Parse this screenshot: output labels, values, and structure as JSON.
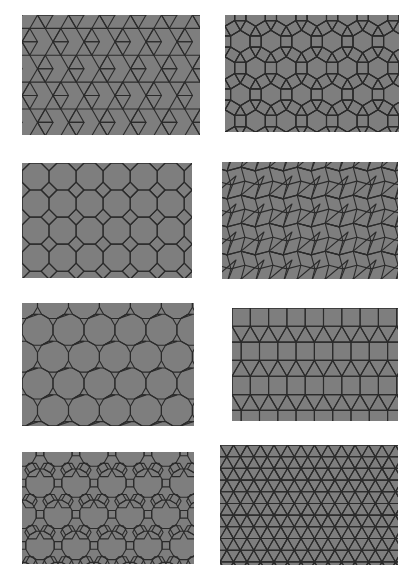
{
  "figure": {
    "background": "#ffffff",
    "tile_fill": "#7e7e7e",
    "edge_color": "#2b2b2b",
    "panels": [
      {
        "id": "trihexagonal",
        "vertex_config": "3.6.3.6",
        "polygons": [
          "triangle",
          "hexagon"
        ],
        "box": [
          22,
          15,
          178,
          120
        ],
        "edge": 15.5,
        "rot": 0
      },
      {
        "id": "rhombitrihexagonal",
        "vertex_config": "3.4.6.4",
        "polygons": [
          "triangle",
          "square",
          "hexagon"
        ],
        "box": [
          225,
          15,
          174,
          117
        ],
        "edge": 11.2,
        "rot": 0
      },
      {
        "id": "truncated-square",
        "vertex_config": "4.8.8",
        "polygons": [
          "square",
          "octagon"
        ],
        "box": [
          22,
          163,
          170,
          115
        ],
        "edge": 11.2,
        "rot": 0
      },
      {
        "id": "snub-square",
        "vertex_config": "3.3.4.3.4",
        "polygons": [
          "triangle",
          "square"
        ],
        "box": [
          222,
          162,
          176,
          117
        ],
        "edge": 14.5,
        "rot": 0
      },
      {
        "id": "truncated-hexagonal",
        "vertex_config": "3.12.12",
        "polygons": [
          "triangle",
          "dodecagon"
        ],
        "box": [
          22,
          303,
          172,
          123
        ],
        "edge": 8.3,
        "rot": 0
      },
      {
        "id": "elongated-triangular",
        "vertex_config": "3.3.3.4.4",
        "polygons": [
          "triangle",
          "square"
        ],
        "box": [
          232,
          308,
          166,
          113
        ],
        "edge": 18.3,
        "rot": 0
      },
      {
        "id": "truncated-trihexagonal",
        "vertex_config": "4.6.12",
        "polygons": [
          "square",
          "hexagon",
          "dodecagon"
        ],
        "box": [
          22,
          452,
          172,
          112
        ],
        "edge": 7.6,
        "rot": 0
      },
      {
        "id": "snub-hexagonal",
        "vertex_config": "3.3.3.3.6",
        "polygons": [
          "triangle",
          "hexagon"
        ],
        "box": [
          220,
          445,
          178,
          120
        ],
        "edge": 13.5,
        "rot": 0
      }
    ]
  }
}
